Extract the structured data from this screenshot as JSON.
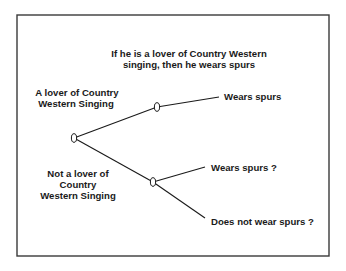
{
  "diagram": {
    "title": {
      "line1": "If he is a lover of Country Western",
      "line2": "singing, then he wears spurs"
    },
    "branches": {
      "lover": {
        "line1": "A lover of Country",
        "line2": "Western Singing"
      },
      "not_lover": {
        "line1": "Not a lover of",
        "line2": "Country",
        "line3": "Western Singing"
      }
    },
    "outcomes": {
      "lover_wears": "Wears spurs",
      "not_lover_wears": "Wears spurs ?",
      "not_lover_not_wears": "Does not wear spurs ?"
    },
    "nodes": [
      {
        "id": "root",
        "x": 74,
        "y": 138
      },
      {
        "id": "lover",
        "x": 157,
        "y": 107
      },
      {
        "id": "not_lover",
        "x": 153,
        "y": 182
      }
    ],
    "colors": {
      "ink": "#1a1a1a",
      "border": "#3a3a3a",
      "background": "#ffffff"
    }
  }
}
